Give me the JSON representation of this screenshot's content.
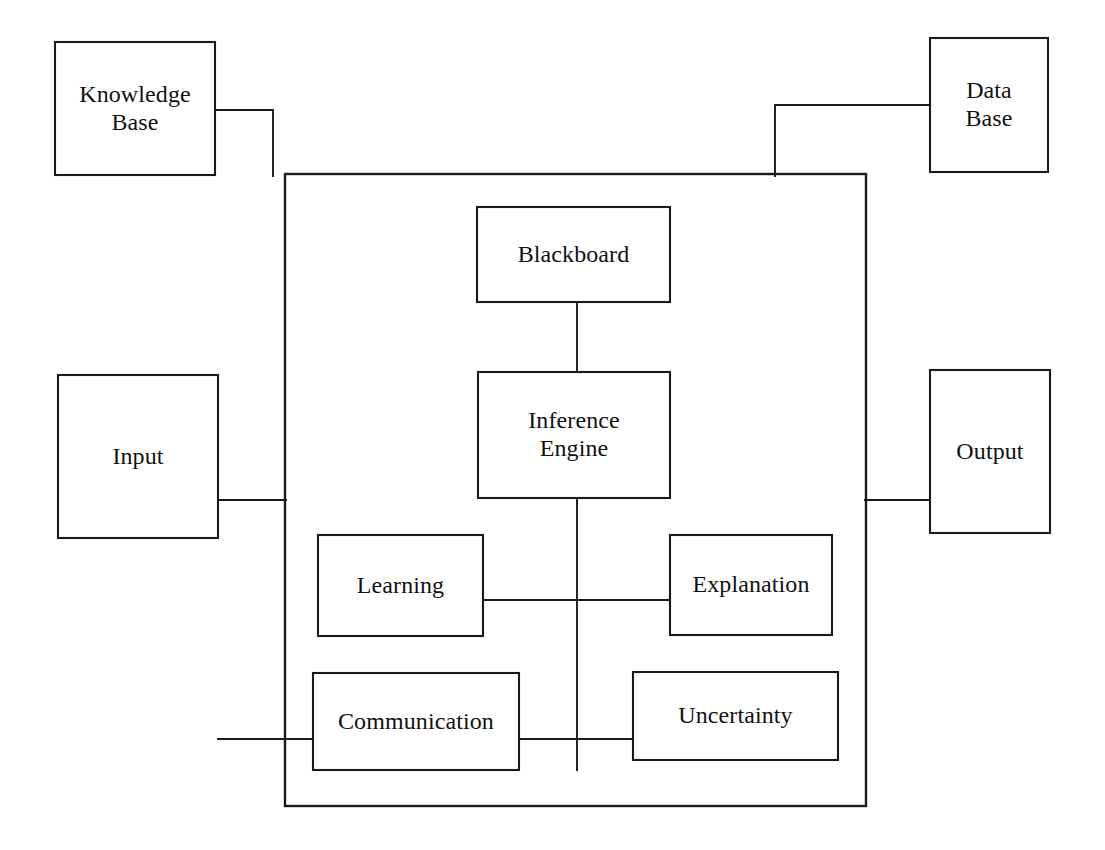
{
  "diagram": {
    "background_color": "#ffffff",
    "line_color": "#1a1a1a",
    "text_color": "#111111",
    "container": {
      "name": "expert-system-boundary",
      "x": 285,
      "y": 174,
      "width": 581,
      "height": 632
    },
    "nodes": [
      {
        "id": "knowledge-base",
        "label": "Knowledge\nBase",
        "line1": "Knowledge",
        "line2": "Base",
        "x": 55,
        "y": 42,
        "width": 160,
        "height": 133,
        "inside_container": false
      },
      {
        "id": "data-base",
        "label": "Data\nBase",
        "line1": "Data",
        "line2": "Base",
        "x": 930,
        "y": 38,
        "width": 118,
        "height": 134,
        "inside_container": false
      },
      {
        "id": "input",
        "label": "Input",
        "line1": "Input",
        "line2": "",
        "x": 58,
        "y": 375,
        "width": 160,
        "height": 163,
        "inside_container": false
      },
      {
        "id": "output",
        "label": "Output",
        "line1": "Output",
        "line2": "",
        "x": 930,
        "y": 370,
        "width": 120,
        "height": 163,
        "inside_container": false
      },
      {
        "id": "blackboard",
        "label": "Blackboard",
        "line1": "Blackboard",
        "line2": "",
        "x": 477,
        "y": 207,
        "width": 193,
        "height": 95,
        "inside_container": true
      },
      {
        "id": "inference-engine",
        "label": "Inference\nEngine",
        "line1": "Inference",
        "line2": "Engine",
        "x": 478,
        "y": 372,
        "width": 192,
        "height": 126,
        "inside_container": true
      },
      {
        "id": "learning",
        "label": "Learning",
        "line1": "Learning",
        "line2": "",
        "x": 318,
        "y": 535,
        "width": 165,
        "height": 101,
        "inside_container": true
      },
      {
        "id": "explanation",
        "label": "Explanation",
        "line1": "Explanation",
        "line2": "",
        "x": 670,
        "y": 535,
        "width": 162,
        "height": 100,
        "inside_container": true
      },
      {
        "id": "communication",
        "label": "Communication",
        "line1": "Communication",
        "line2": "",
        "x": 313,
        "y": 673,
        "width": 206,
        "height": 97,
        "inside_container": true
      },
      {
        "id": "uncertainty",
        "label": "Uncertainty",
        "line1": "Uncertainty",
        "line2": "",
        "x": 633,
        "y": 672,
        "width": 205,
        "height": 88,
        "inside_container": true
      }
    ],
    "connectors": [
      {
        "id": "knowledge-base-to-boundary",
        "from": "knowledge-base",
        "to": "expert-system-boundary",
        "points": "215,110 273,110 273,176"
      },
      {
        "id": "data-base-to-boundary",
        "from": "data-base",
        "to": "expert-system-boundary",
        "points": "930,105 775,105 775,176"
      },
      {
        "id": "input-to-boundary",
        "from": "input",
        "to": "expert-system-boundary",
        "points": "218,500 286,500"
      },
      {
        "id": "boundary-to-output",
        "from": "expert-system-boundary",
        "to": "output",
        "points": "865,500 930,500"
      },
      {
        "id": "blackboard-to-inference-engine",
        "from": "blackboard",
        "to": "inference-engine",
        "points": "577,302 577,372"
      },
      {
        "id": "inference-engine-bus",
        "from": "inference-engine",
        "to": "communication-row",
        "points": "577,498 577,770"
      },
      {
        "id": "learning-to-bus",
        "from": "learning",
        "to": "inference-engine-bus",
        "points": "483,600 577,600"
      },
      {
        "id": "bus-to-explanation",
        "from": "inference-engine-bus",
        "to": "explanation",
        "points": "577,600 670,600"
      },
      {
        "id": "external-to-communication",
        "from": "outside",
        "to": "communication",
        "points": "218,739 313,739"
      },
      {
        "id": "communication-to-bus",
        "from": "communication",
        "to": "inference-engine-bus",
        "points": "519,739 577,739"
      },
      {
        "id": "bus-to-uncertainty",
        "from": "inference-engine-bus",
        "to": "uncertainty",
        "points": "577,739 633,739"
      }
    ]
  }
}
